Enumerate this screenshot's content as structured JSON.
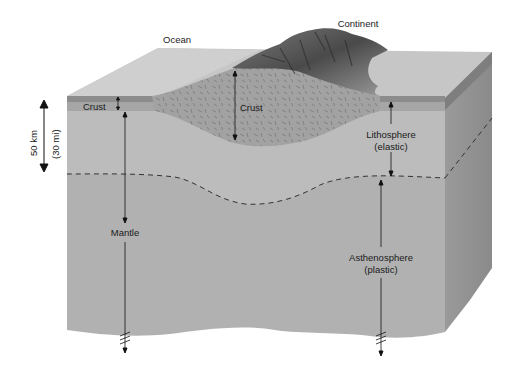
{
  "diagram": {
    "top_labels": {
      "ocean": "Ocean",
      "continent": "Continent"
    },
    "layers": {
      "oceanic_crust": "Crust",
      "continental_crust": "Crust",
      "lithosphere": "Lithosphere",
      "lithosphere_note": "(elastic)",
      "mantle": "Mantle",
      "asthenosphere": "Asthenosphere",
      "asthenosphere_note": "(plastic)"
    },
    "scale_bar": {
      "km": "50 km",
      "mi": "(30 mi)"
    },
    "colors": {
      "top_surface": "#c9c9c9",
      "ocean_crust_dark": "#8f8f8f",
      "ocean_crust": "#a9a9a9",
      "continental_crust": "#a4a4a4",
      "lithosphere": "#b8b8b8",
      "asthenosphere": "#b2b2b2",
      "side_face": "#959595",
      "line": "#222222"
    }
  }
}
